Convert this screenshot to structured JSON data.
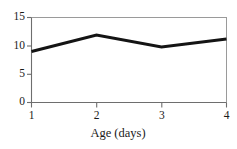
{
  "chart_data": {
    "type": "line",
    "title": "",
    "subtitle": "",
    "xlabel": "Age (days)",
    "ylabel": "",
    "x": [
      1,
      2,
      3,
      4
    ],
    "values": [
      9.0,
      11.9,
      9.8,
      11.2
    ],
    "series": [
      {
        "name": "",
        "x": [
          1,
          2,
          3,
          4
        ],
        "values": [
          9.0,
          11.9,
          9.8,
          11.2
        ]
      }
    ],
    "xlim": [
      1,
      4
    ],
    "ylim": [
      0,
      15
    ],
    "xticks": [
      1,
      2,
      3,
      4
    ],
    "yticks": [
      0,
      5,
      10,
      15
    ],
    "xticklabels": [
      "1",
      "2",
      "3",
      "4"
    ],
    "yticklabels": [
      "0",
      "5",
      "10",
      "15"
    ],
    "grid": false,
    "legend": null,
    "legend_position": "none",
    "annotations": [],
    "line_color": "#141414",
    "line_width": 3,
    "axis_color": "#6e6e6e",
    "text_color": "#1a1a1a",
    "background_color": "#ffffff",
    "frame": {
      "top": true,
      "right": true,
      "bottom": true,
      "left": true
    }
  },
  "axis": {
    "x_title": "Age (days)",
    "x_tick_labels": [
      "1",
      "2",
      "3",
      "4"
    ],
    "y_tick_labels": [
      "0",
      "5",
      "10",
      "15"
    ]
  }
}
